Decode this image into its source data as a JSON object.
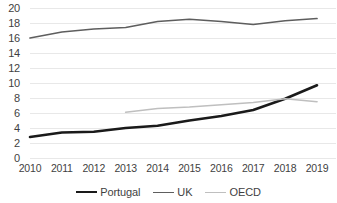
{
  "chart_data": {
    "type": "line",
    "title": "",
    "subtitle": "",
    "xlabel": "",
    "ylabel": "",
    "categories": [
      "2010",
      "2011",
      "2012",
      "2013",
      "2014",
      "2015",
      "2016",
      "2017",
      "2018",
      "2019"
    ],
    "x": [
      2010,
      2011,
      2012,
      2013,
      2014,
      2015,
      2016,
      2017,
      2018,
      2019
    ],
    "ylim": [
      0,
      20
    ],
    "ytick_labels": [
      "20",
      "18",
      "16",
      "14",
      "12",
      "10",
      "8",
      "6",
      "4",
      "2",
      "0"
    ],
    "yticks": [
      20,
      18,
      16,
      14,
      12,
      10,
      8,
      6,
      4,
      2,
      0
    ],
    "grid": true,
    "grid_axis": "y",
    "legend_position": "bottom",
    "series": [
      {
        "name": "Portugal",
        "color": "#1a1a1a",
        "line_width": 2.6,
        "values": [
          2.8,
          3.4,
          3.5,
          4.0,
          4.3,
          5.0,
          5.6,
          6.4,
          7.9,
          9.7
        ]
      },
      {
        "name": "UK",
        "color": "#5e5e5e",
        "line_width": 1.7,
        "values": [
          16.0,
          16.8,
          17.2,
          17.4,
          18.2,
          18.5,
          18.2,
          17.8,
          18.3,
          18.6
        ]
      },
      {
        "name": "OECD",
        "color": "#bfbfbf",
        "line_width": 1.7,
        "values": [
          null,
          null,
          null,
          6.1,
          6.6,
          6.8,
          7.1,
          7.4,
          7.9,
          7.5
        ]
      }
    ]
  },
  "legend": {
    "items": [
      {
        "label": "Portugal",
        "color": "#1a1a1a",
        "width": "2.6px"
      },
      {
        "label": "UK",
        "color": "#5e5e5e",
        "width": "1.7px"
      },
      {
        "label": "OECD",
        "color": "#bfbfbf",
        "width": "1.7px"
      }
    ]
  },
  "axes": {
    "grid_color": "#e8e8e8",
    "text_color": "#3f3f3f"
  }
}
